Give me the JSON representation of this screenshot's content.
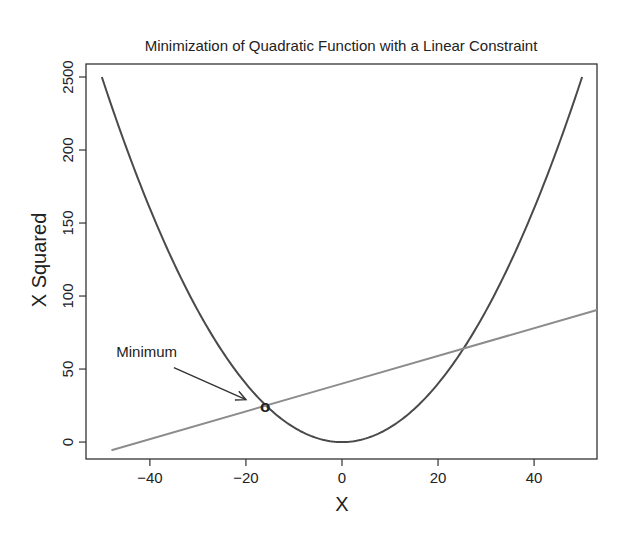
{
  "chart_data": {
    "type": "line",
    "title": "Minimization of Quadratic Function with a Linear Constraint",
    "xlabel": "X",
    "ylabel": "X Squared",
    "xlim": [
      -53.3,
      53.1
    ],
    "ylim": [
      -11.6,
      258.9
    ],
    "grid": false,
    "x_ticks": [
      {
        "value": -40,
        "label": "−40"
      },
      {
        "value": -20,
        "label": "−20"
      },
      {
        "value": 0,
        "label": "0"
      },
      {
        "value": 20,
        "label": "20"
      },
      {
        "value": 40,
        "label": "40"
      }
    ],
    "y_ticks": [
      {
        "value": 0,
        "label": "0"
      },
      {
        "value": 50,
        "label": "50"
      },
      {
        "value": 100,
        "label": "100"
      },
      {
        "value": 150,
        "label": "150"
      },
      {
        "value": 200,
        "label": "200"
      },
      {
        "value": 250,
        "label": "2500"
      }
    ],
    "series": [
      {
        "name": "quadratic",
        "function": "y = x^2 / 10",
        "x_range": [
          -50,
          50
        ],
        "color": "#4a4a4a",
        "points": [
          [
            -50,
            250
          ],
          [
            -40,
            160
          ],
          [
            -30,
            90
          ],
          [
            -20,
            40
          ],
          [
            -10,
            10
          ],
          [
            0,
            0
          ],
          [
            10,
            10
          ],
          [
            20,
            40
          ],
          [
            30,
            90
          ],
          [
            40,
            160
          ],
          [
            50,
            250
          ]
        ]
      },
      {
        "name": "linear constraint",
        "function": "y = 0.95x + 40",
        "x_range": [
          -48,
          53.1
        ],
        "color": "#8c8c8c",
        "points": [
          [
            -48,
            -5.6
          ],
          [
            0,
            40
          ],
          [
            53.1,
            90.4
          ]
        ]
      }
    ],
    "marker": {
      "label": "o",
      "x": -16,
      "y": 24.8
    },
    "annotations": [
      {
        "text": "Minimum",
        "x": -47,
        "y": 58,
        "arrow_from": [
          -35,
          51
        ],
        "arrow_to": [
          -20,
          29
        ]
      }
    ],
    "intersections": [
      [
        -16,
        24.8
      ],
      [
        25.5,
        64.2
      ]
    ]
  },
  "colors": {
    "curve": "#4a4a4a",
    "line": "#8c8c8c",
    "axis": "#333333",
    "background": "#ffffff"
  }
}
